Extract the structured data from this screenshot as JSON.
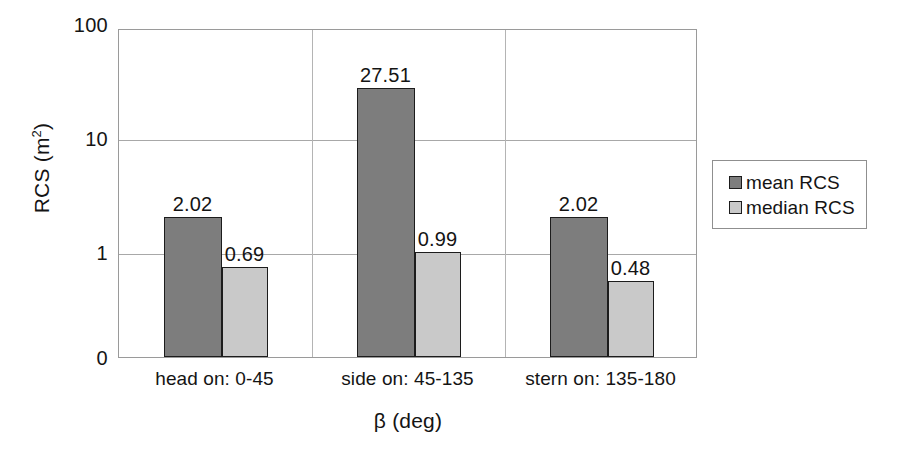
{
  "chart_data": {
    "type": "bar",
    "title": "",
    "xlabel": "β (deg)",
    "ylabel": "RCS (m²)",
    "ylabel_base": "RCS (m",
    "ylabel_exp": "2",
    "ylabel_close": ")",
    "yscale": "log",
    "ylim": [
      0,
      100
    ],
    "yticks": [
      "100",
      "10",
      "1",
      "0"
    ],
    "ytick_values": [
      100,
      10,
      1,
      0
    ],
    "grid": true,
    "legend_position": "right",
    "categories": [
      "head on:  0-45",
      "side on: 45-135",
      "stern on: 135-180"
    ],
    "series": [
      {
        "name": "mean RCS",
        "color": "#7d7d7d",
        "values": [
          2.02,
          27.51,
          2.02
        ],
        "labels": [
          "2.02",
          "27.51",
          "2.02"
        ]
      },
      {
        "name": "median RCS",
        "color": "#c9c9c9",
        "values": [
          0.69,
          0.99,
          0.48
        ],
        "labels": [
          "0.69",
          "0.99",
          "0.48"
        ]
      }
    ]
  },
  "legend": {
    "items": [
      {
        "label": "mean RCS",
        "color": "#7d7d7d"
      },
      {
        "label": "median RCS",
        "color": "#c9c9c9"
      }
    ]
  },
  "colors": {
    "mean": "#7d7d7d",
    "median": "#c9c9c9",
    "bar_outline": "#1c1c1c",
    "grid": "#a8a8a8",
    "frame": "#9a9a9a",
    "text": "#141414",
    "background": "#ffffff"
  }
}
